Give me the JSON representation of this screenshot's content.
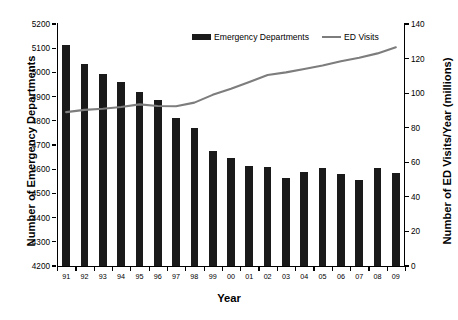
{
  "chart_data": {
    "type": "bar",
    "title": "",
    "subtitle": "",
    "xlabel": "Year",
    "ylabel": "Number of Emergency Departments",
    "ylabel_secondary": "Number of ED Visits/Year (millions)",
    "grid": false,
    "legend_position": "top-center",
    "categories": [
      "91",
      "92",
      "93",
      "94",
      "95",
      "96",
      "97",
      "98",
      "99",
      "00",
      "01",
      "02",
      "03",
      "04",
      "05",
      "06",
      "07",
      "08",
      "09"
    ],
    "ylim": [
      4200,
      5200
    ],
    "yticks": [
      4200,
      4300,
      4400,
      4500,
      4600,
      4700,
      4800,
      4900,
      5000,
      5100,
      5200
    ],
    "ylim_secondary": [
      0,
      140
    ],
    "yticks_secondary": [
      0,
      20,
      40,
      60,
      80,
      100,
      120,
      140
    ],
    "series": [
      {
        "name": "Emergency Departments",
        "kind": "bar",
        "axis": "left",
        "color": "#1a1a1a",
        "values": [
          5115,
          5035,
          4995,
          4960,
          4920,
          4885,
          4810,
          4770,
          4675,
          4645,
          4615,
          4610,
          4565,
          4590,
          4605,
          4580,
          4555,
          4605,
          4585
        ]
      },
      {
        "name": "ED Visits",
        "kind": "line",
        "axis": "right",
        "color": "#7d7d7d",
        "values": [
          89.0,
          90.3,
          91.0,
          92.0,
          93.5,
          92.6,
          92.4,
          94.5,
          99.0,
          102.5,
          106.5,
          110.5,
          112.0,
          114.0,
          116.0,
          118.5,
          120.5,
          123.0,
          126.5
        ]
      }
    ]
  },
  "legend": {
    "items": [
      {
        "label": "Emergency Departments",
        "marker": "bar-swatch",
        "color": "#1a1a1a"
      },
      {
        "label": "ED Visits",
        "marker": "line-swatch",
        "color": "#7d7d7d"
      }
    ]
  },
  "axes": {
    "left_title": "Number of Emergency Departments",
    "right_title": "Number of ED Visits/Year (millions)",
    "x_title": "Year"
  }
}
